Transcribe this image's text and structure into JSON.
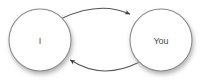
{
  "diagram": {
    "type": "cycle-diagram",
    "background_color": "#ffffff",
    "nodes": [
      {
        "id": "node-i",
        "label": "I",
        "shape": "circle",
        "center_x": 40,
        "center_y": 40,
        "radius": 31,
        "fill_color": "#ffffff",
        "stroke_color": "#8a8a8a",
        "label_color": "#4a4a4a"
      },
      {
        "id": "node-you",
        "label": "You",
        "shape": "circle",
        "center_x": 161,
        "center_y": 40,
        "radius": 31,
        "fill_color": "#ffffff",
        "stroke_color": "#8a8a8a",
        "label_color": "#4a4a4a"
      }
    ],
    "edges": [
      {
        "id": "edge-i-to-you",
        "from": "node-i",
        "to": "node-you",
        "label": "",
        "direction": "left-to-right",
        "curve": "arc-above",
        "stroke_color": "#555555",
        "arrowhead": "filled-triangle"
      },
      {
        "id": "edge-you-to-i",
        "from": "node-you",
        "to": "node-i",
        "label": "",
        "direction": "right-to-left",
        "curve": "arc-below",
        "stroke_color": "#555555",
        "arrowhead": "filled-triangle"
      }
    ],
    "shadow": {
      "color": "#b8b8b8",
      "offset_x": 1,
      "offset_y": 3,
      "blur": 3
    }
  }
}
